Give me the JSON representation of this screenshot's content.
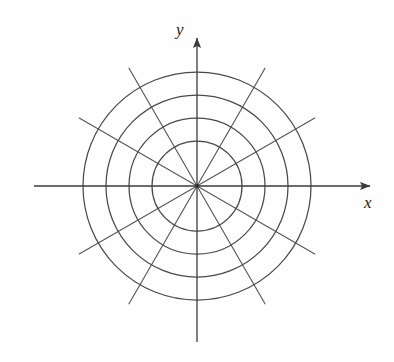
{
  "figure": {
    "background_color": "#fefefe",
    "stroke_color": "#4a4a4a",
    "axis_color": "#3b3b3b",
    "label_color": "#1c1c1c",
    "width": 394,
    "height": 362
  },
  "axes": {
    "x_label": "x",
    "y_label": "y",
    "center": {
      "x": 197,
      "y": 186
    },
    "x_axis": {
      "x_start": 34,
      "x_end": 377,
      "y": 186,
      "arrow": "right"
    },
    "y_axis": {
      "y_start": 342,
      "y_end": 30,
      "x": 197,
      "arrow": "up"
    }
  },
  "chart_data": {
    "type": "line",
    "xlabel": "x",
    "ylabel": "y",
    "grid": true,
    "legend": null,
    "coordinate_system": "polar",
    "center_px": [
      197,
      186
    ],
    "circle_count": 4,
    "circle_radii_px": [
      45,
      68,
      91,
      114
    ],
    "circle_radii_units": [
      1,
      2,
      3,
      4
    ],
    "spoke_count": 12,
    "spoke_angles_deg": [
      0,
      30,
      60,
      90,
      120,
      150,
      180,
      210,
      240,
      270,
      300,
      330
    ],
    "spoke_radius_px": 136,
    "diagonal_spoke_angles_deg": [
      30,
      60,
      120,
      150,
      210,
      240,
      300,
      330
    ],
    "xlim": [
      -4.4,
      4.4
    ],
    "ylim": [
      -4.4,
      4.4
    ]
  }
}
